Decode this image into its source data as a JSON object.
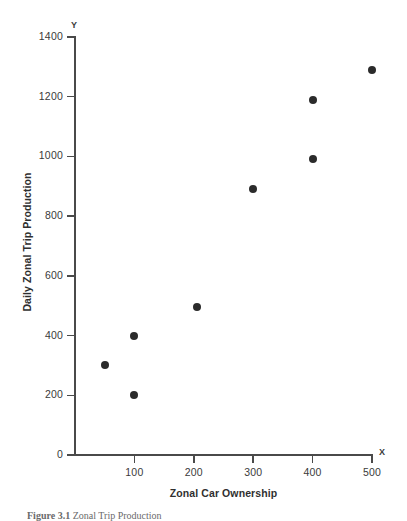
{
  "chart_data": {
    "type": "scatter",
    "title": "",
    "xlabel": "Zonal Car Ownership",
    "ylabel": "Daily Zonal Trip Production",
    "x_axis_letter": "X",
    "y_axis_letter": "Y",
    "xlim": [
      0,
      500
    ],
    "ylim": [
      0,
      1400
    ],
    "grid": false,
    "legend": null,
    "xticks": [
      0,
      100,
      200,
      300,
      400,
      500
    ],
    "xtick_labels": [
      "",
      "100",
      "200",
      "300",
      "400",
      "500"
    ],
    "yticks": [
      0,
      200,
      400,
      600,
      800,
      1000,
      1200,
      1400
    ],
    "ytick_labels": [
      "0",
      "200",
      "400",
      "600",
      "800",
      "1000",
      "1200",
      "1400"
    ],
    "points": [
      {
        "x": 50,
        "y": 300
      },
      {
        "x": 100,
        "y": 400
      },
      {
        "x": 100,
        "y": 200
      },
      {
        "x": 205,
        "y": 495
      },
      {
        "x": 300,
        "y": 890
      },
      {
        "x": 400,
        "y": 990
      },
      {
        "x": 400,
        "y": 1190
      },
      {
        "x": 500,
        "y": 1290
      }
    ],
    "marker": "filled-circle",
    "marker_color": "#2b2b2b"
  },
  "caption": {
    "figure_number": "Figure 3.1",
    "text": "Zonal Trip Production"
  }
}
